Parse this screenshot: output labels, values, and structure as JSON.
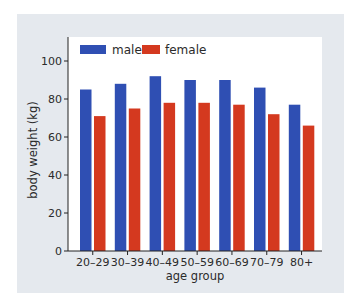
{
  "chart_data": {
    "type": "bar",
    "title": "",
    "xlabel": "age group",
    "ylabel": "body weight (kg)",
    "ylim": [
      0,
      110
    ],
    "yticks": [
      0,
      20,
      40,
      60,
      80,
      100
    ],
    "grid": false,
    "legend_position": "top-left inside",
    "categories": [
      "20–29",
      "30–39",
      "40–49",
      "50–59",
      "60–69",
      "70–79",
      "80+"
    ],
    "series": [
      {
        "name": "male",
        "color": "#2f4fb3",
        "values": [
          85,
          88,
          92,
          90,
          90,
          86,
          77
        ]
      },
      {
        "name": "female",
        "color": "#d4391f",
        "values": [
          71,
          75,
          78,
          78,
          77,
          72,
          66
        ]
      }
    ]
  },
  "legend": {
    "male_label": "male",
    "female_label": "female"
  },
  "axes": {
    "x_title": "age group",
    "y_title": "body weight (kg)"
  }
}
